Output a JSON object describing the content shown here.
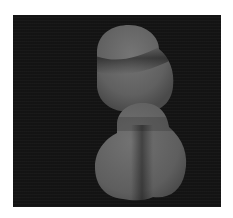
{
  "image": {
    "description": "Grayscale micrograph of two rounded cell-like blobs on a dark background",
    "background_color": "#141414",
    "border_color": "#ffffff",
    "blob_color": "#6a6a6a",
    "shadow_color": "#3a3a3a"
  }
}
